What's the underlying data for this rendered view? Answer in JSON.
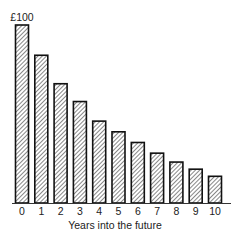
{
  "chart_data": {
    "type": "bar",
    "title": "",
    "xlabel": "Years into the future",
    "ylabel": "",
    "categories": [
      "0",
      "1",
      "2",
      "3",
      "4",
      "5",
      "6",
      "7",
      "8",
      "9",
      "10"
    ],
    "values": [
      100,
      83,
      67,
      57,
      46,
      40,
      34,
      28,
      23,
      19,
      15
    ],
    "annotations": [
      {
        "category": "0",
        "text": "£100"
      }
    ],
    "ylim": [
      0,
      100
    ],
    "grid": false,
    "legend": null,
    "bar_style": {
      "fill": "hatched",
      "hatch_color": "#555555",
      "border": "#111111"
    }
  },
  "labels": {
    "top_annotation": "£100",
    "xlabel": "Years into the future"
  }
}
